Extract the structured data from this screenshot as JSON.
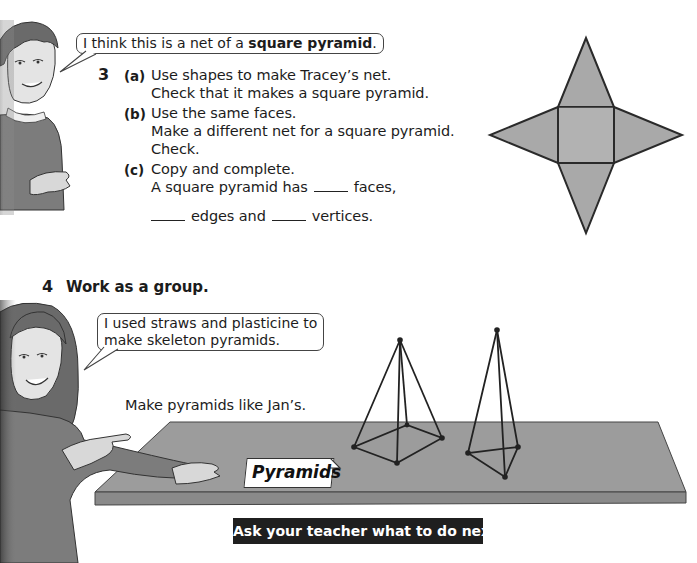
{
  "question3": {
    "number": "3",
    "speech_bubble": {
      "prefix": "I think this is a net of a ",
      "bold": "square pyramid",
      "suffix": "."
    },
    "parts": [
      {
        "label": "(a)",
        "lines": [
          "Use shapes to make Tracey’s net.",
          "Check that it makes a square pyramid."
        ]
      },
      {
        "label": "(b)",
        "lines": [
          "Use the same faces.",
          "Make a different net for a square pyramid.",
          "Check."
        ]
      },
      {
        "label": "(c)",
        "lines": [
          "Copy and complete."
        ],
        "fill_line_1_start": "A square pyramid has",
        "fill_line_1_end": "faces,",
        "fill_line_2_mid": "edges and",
        "fill_line_2_end": "vertices."
      }
    ],
    "figure": {
      "name": "square-pyramid-net",
      "fill": "#a8a8a8",
      "stroke": "#2a2a2a"
    }
  },
  "question4": {
    "number": "4",
    "heading": "Work as a group.",
    "speech_bubble": {
      "lines": [
        "I used straws and plasticine to",
        "make skeleton pyramids."
      ]
    },
    "instruction": "Make pyramids like Jan’s.",
    "table_label": "Pyramids",
    "table_color": "#9a9a9a"
  },
  "footer": {
    "text": "Ask your teacher what to do next."
  }
}
